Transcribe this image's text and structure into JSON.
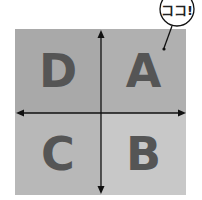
{
  "diagram": {
    "type": "quadrant",
    "quadrants": [
      {
        "position": "top-left",
        "label": "D",
        "color": "#a9a9a9"
      },
      {
        "position": "top-right",
        "label": "A",
        "color": "#b0b0b0"
      },
      {
        "position": "bottom-left",
        "label": "C",
        "color": "#b8b8b8"
      },
      {
        "position": "bottom-right",
        "label": "B",
        "color": "#c8c8c8"
      }
    ],
    "axes": {
      "horizontal": "double-arrow",
      "vertical": "double-arrow",
      "color": "#111111"
    },
    "callout": {
      "text": "ココ!",
      "points_to": "A"
    },
    "letter_color": "#555555"
  }
}
